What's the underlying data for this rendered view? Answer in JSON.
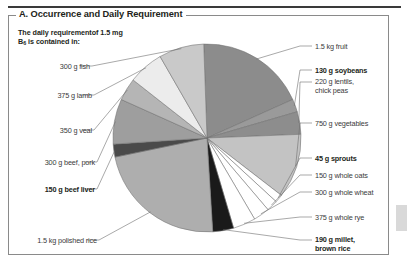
{
  "panel": {
    "title": "A. Occurrence and Daily Requirement",
    "subtitle_line1": "The daily requirementof 1.5 mg",
    "subtitle_line2_pre": "B",
    "subtitle_line2_sub": "6",
    "subtitle_line2_post": " is contained in:"
  },
  "chart_data": {
    "type": "pie",
    "title": "A. Occurrence and Daily Requirement",
    "subtitle": "The daily requirementof 1.5 mg B6 is contained in:",
    "legend": "none",
    "grid": false,
    "note": "Each slice is one food source supplying the 1.5 mg daily vitamin B6 requirement; slice angles read off the figure in degrees.",
    "labels": [
      "1.5 kg fruit",
      "130 g soybeans",
      "220 g lentils, chick peas",
      "750 g vegetables",
      "45 g sprouts",
      "150 g whole oats",
      "300 g whole wheat",
      "375 g whole rye",
      "190 g millet, brown rice",
      "1.5 kg polished rice",
      "150 g beef liver",
      "300 g beef, pork",
      "350 g veal",
      "375 g lamb",
      "300 g fish"
    ],
    "values_deg": [
      68,
      8,
      14,
      40,
      5,
      7,
      10,
      14,
      13,
      82,
      8,
      28,
      14,
      22,
      28
    ],
    "colors": [
      "#8c8c8c",
      "#9a9a9a",
      "#8d8d8d",
      "#c3c3c3",
      "#ffffff",
      "#ffffff",
      "#ffffff",
      "#ffffff",
      "#1a1a1a",
      "#aeaeae",
      "#4a4a4a",
      "#9e9e9e",
      "#b5b5b5",
      "#ececec",
      "#c9c9c9"
    ]
  },
  "labels_right": [
    {
      "text": "1.5 kg fruit",
      "bold": false
    },
    {
      "text": "130 g soybeans",
      "bold": true
    },
    {
      "text": "220 g lentils,",
      "text2": "chick peas",
      "bold": false
    },
    {
      "text": "750 g vegetables",
      "bold": false
    },
    {
      "text": "45 g sprouts",
      "bold": true
    },
    {
      "text": "150 g whole oats",
      "bold": false
    },
    {
      "text": "300 g whole wheat",
      "bold": false
    },
    {
      "text": "375 g whole rye",
      "bold": false
    },
    {
      "text": "190 g millet,",
      "text2": "brown rice",
      "bold": true
    }
  ],
  "labels_left": [
    {
      "text": "300 g fish",
      "bold": false
    },
    {
      "text": "375 g lamb",
      "bold": false
    },
    {
      "text": "350 g veal",
      "bold": false
    },
    {
      "text": "300 g beef, pork",
      "bold": false
    },
    {
      "text": "150 g beef liver",
      "bold": true
    },
    {
      "text": "1.5 kg polished rice",
      "bold": false
    }
  ]
}
